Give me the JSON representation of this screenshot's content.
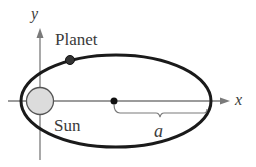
{
  "diagram": {
    "labels": {
      "planet": "Planet",
      "sun": "Sun",
      "semi_major_axis": "a",
      "x_axis": "x",
      "y_axis": "y"
    },
    "colors": {
      "ellipse": "#1a1a1a",
      "axes": "#7a7a7a",
      "sun_fill": "#dcdcdc",
      "sun_stroke": "#555555",
      "planet_fill": "#333333",
      "text": "#3a3a3a"
    }
  }
}
